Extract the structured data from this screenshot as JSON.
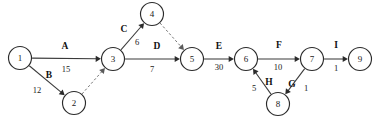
{
  "diagram": {
    "kind": "activity-on-arrow-network",
    "title": "",
    "canvas": {
      "width": 380,
      "height": 122,
      "background": "#ffffff"
    },
    "colors": {
      "node_stroke": "#2b2b2b",
      "node_fill": "#ffffff",
      "edge_solid": "#3a3a3a",
      "edge_dashed": "#6a6a6a",
      "text": "#111111"
    },
    "nodes": [
      {
        "id": "n1",
        "label": "1",
        "cx": 20,
        "cy": 58,
        "r": 11.5
      },
      {
        "id": "n2",
        "label": "2",
        "cx": 74,
        "cy": 103,
        "r": 11.5
      },
      {
        "id": "n3",
        "label": "3",
        "cx": 113,
        "cy": 59,
        "r": 11.5
      },
      {
        "id": "n4",
        "label": "4",
        "cx": 152,
        "cy": 14,
        "r": 11.5
      },
      {
        "id": "n5",
        "label": "5",
        "cx": 192,
        "cy": 59,
        "r": 11.5
      },
      {
        "id": "n6",
        "label": "6",
        "cx": 246,
        "cy": 59,
        "r": 11.5
      },
      {
        "id": "n7",
        "label": "7",
        "cx": 312,
        "cy": 59,
        "r": 11.5
      },
      {
        "id": "n8",
        "label": "8",
        "cx": 278,
        "cy": 104,
        "r": 11.5
      },
      {
        "id": "n9",
        "label": "9",
        "cx": 360,
        "cy": 59,
        "r": 11.5
      }
    ],
    "edges": [
      {
        "id": "e-A",
        "from": "n1",
        "to": "n3",
        "name": "A",
        "weight": "15",
        "style": "solid",
        "arrow": true,
        "name_x": 65,
        "name_y": 47,
        "weight_x": 66,
        "weight_y": 70
      },
      {
        "id": "e-B",
        "from": "n1",
        "to": "n2",
        "name": "B",
        "weight": "12",
        "style": "solid",
        "arrow": true,
        "name_x": 49,
        "name_y": 76,
        "weight_x": 37,
        "weight_y": 91
      },
      {
        "id": "e-dummy-23",
        "from": "n2",
        "to": "n3",
        "name": "",
        "weight": "",
        "style": "dashed",
        "arrow": true,
        "name_x": 0,
        "name_y": 0,
        "weight_x": 0,
        "weight_y": 0
      },
      {
        "id": "e-C",
        "from": "n3",
        "to": "n4",
        "name": "C",
        "weight": "6",
        "style": "solid",
        "arrow": true,
        "name_x": 124,
        "name_y": 30,
        "weight_x": 137,
        "weight_y": 43
      },
      {
        "id": "e-dummy-45",
        "from": "n4",
        "to": "n5",
        "name": "",
        "weight": "",
        "style": "dashed",
        "arrow": true,
        "name_x": 0,
        "name_y": 0,
        "weight_x": 0,
        "weight_y": 0
      },
      {
        "id": "e-D",
        "from": "n3",
        "to": "n5",
        "name": "D",
        "weight": "7",
        "style": "solid",
        "arrow": true,
        "name_x": 157,
        "name_y": 47,
        "weight_x": 152,
        "weight_y": 70
      },
      {
        "id": "e-E",
        "from": "n5",
        "to": "n6",
        "name": "E",
        "weight": "30",
        "style": "solid",
        "arrow": true,
        "name_x": 219,
        "name_y": 47,
        "weight_x": 219,
        "weight_y": 68
      },
      {
        "id": "e-F",
        "from": "n6",
        "to": "n7",
        "name": "F",
        "weight": "10",
        "style": "solid",
        "arrow": true,
        "name_x": 279,
        "name_y": 46,
        "weight_x": 278,
        "weight_y": 68
      },
      {
        "id": "e-H",
        "from": "n8",
        "to": "n6",
        "name": "H",
        "weight": "5",
        "style": "solid",
        "arrow": true,
        "name_x": 269,
        "name_y": 83,
        "weight_x": 254,
        "weight_y": 89
      },
      {
        "id": "e-G",
        "from": "n7",
        "to": "n8",
        "name": "G",
        "weight": "1",
        "style": "solid",
        "arrow": true,
        "name_x": 292,
        "name_y": 85,
        "weight_x": 306,
        "weight_y": 89
      },
      {
        "id": "e-I",
        "from": "n7",
        "to": "n9",
        "name": "I",
        "weight": "1",
        "style": "solid",
        "arrow": true,
        "name_x": 336,
        "name_y": 46,
        "weight_x": 336,
        "weight_y": 69
      }
    ]
  }
}
